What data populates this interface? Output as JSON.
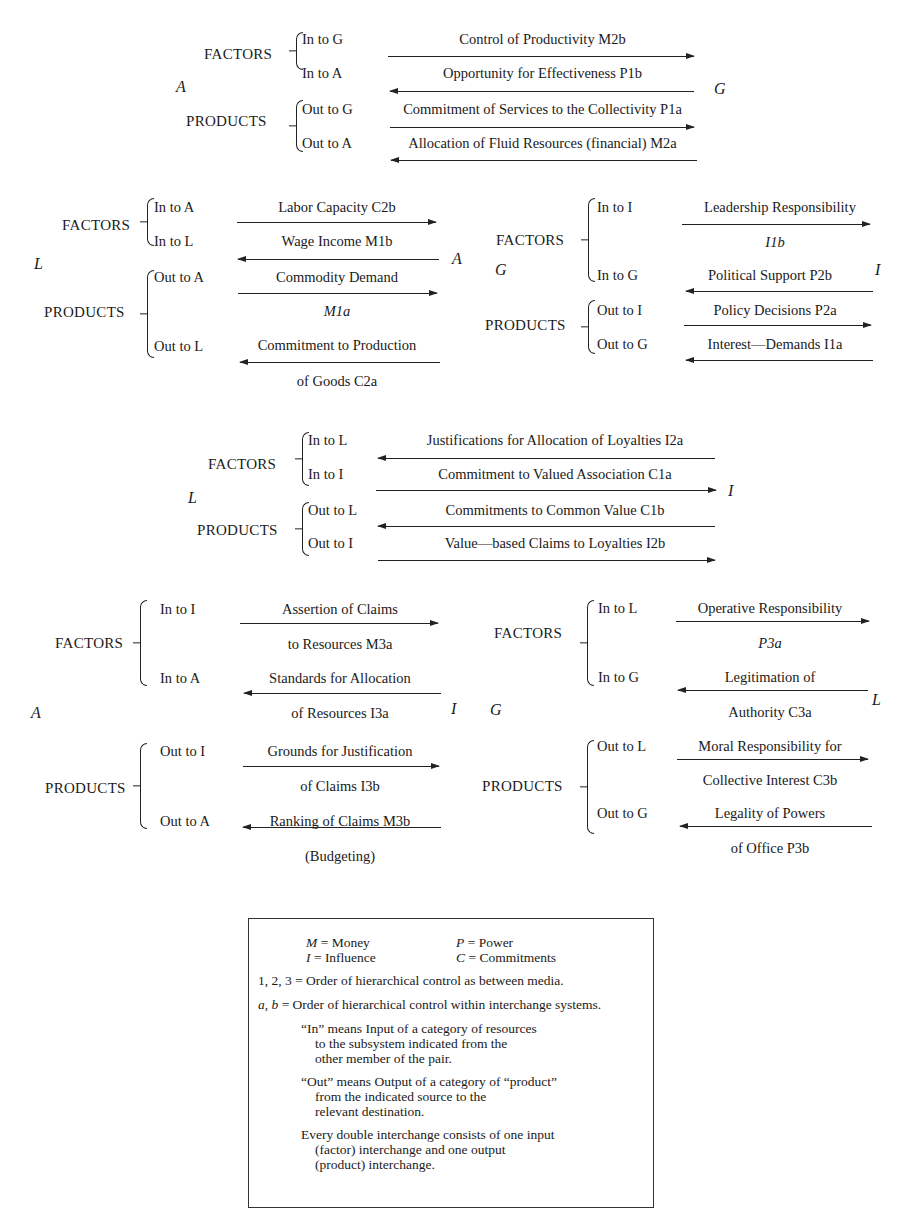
{
  "header": {
    "cutoff_text": ""
  },
  "panels": [
    {
      "id": "A-G",
      "left_node": "A",
      "right_node": "G",
      "factors_label": "FACTORS",
      "products_label": "PRODUCTS",
      "rows": [
        {
          "group": "FACTORS",
          "direction_label": "In to G",
          "text": "Control of Productivity M2b",
          "arrow": "right"
        },
        {
          "group": "FACTORS",
          "direction_label": "In to A",
          "text": "Opportunity for Effectiveness P1b",
          "arrow": "left"
        },
        {
          "group": "PRODUCTS",
          "direction_label": "Out to G",
          "text": "Commitment of Services to the Collectivity P1a",
          "arrow": "right"
        },
        {
          "group": "PRODUCTS",
          "direction_label": "Out to A",
          "text": "Allocation of Fluid Resources (financial) M2a",
          "arrow": "left"
        }
      ]
    },
    {
      "id": "L-A",
      "left_node": "L",
      "right_node": "A",
      "factors_label": "FACTORS",
      "products_label": "PRODUCTS",
      "rows": [
        {
          "group": "FACTORS",
          "direction_label": "In to A",
          "text": "Labor Capacity C2b",
          "arrow": "right"
        },
        {
          "group": "FACTORS",
          "direction_label": "In to L",
          "text": "Wage Income M1b",
          "arrow": "left"
        },
        {
          "group": "PRODUCTS",
          "direction_label": "Out to A",
          "text": "Commodity Demand",
          "text2": "M1a",
          "arrow": "right"
        },
        {
          "group": "PRODUCTS",
          "direction_label": "Out to L",
          "text": "Commitment to Production",
          "text2": "of Goods C2a",
          "arrow": "left"
        }
      ]
    },
    {
      "id": "G-I",
      "left_node": "G",
      "right_node": "I",
      "factors_label": "FACTORS",
      "products_label": "PRODUCTS",
      "rows": [
        {
          "group": "FACTORS",
          "direction_label": "In to I",
          "text": "Leadership Responsibility",
          "text2": "I1b",
          "arrow": "right"
        },
        {
          "group": "FACTORS",
          "direction_label": "In to G",
          "text": "Political Support P2b",
          "arrow": "left"
        },
        {
          "group": "PRODUCTS",
          "direction_label": "Out to I",
          "text": "Policy Decisions P2a",
          "arrow": "right"
        },
        {
          "group": "PRODUCTS",
          "direction_label": "Out to G",
          "text": "Interest—Demands I1a",
          "arrow": "left"
        }
      ]
    },
    {
      "id": "L-I",
      "left_node": "L",
      "right_node": "I",
      "factors_label": "FACTORS",
      "products_label": "PRODUCTS",
      "rows": [
        {
          "group": "FACTORS",
          "direction_label": "In to L",
          "text": "Justifications for Allocation of Loyalties I2a",
          "arrow": "left"
        },
        {
          "group": "FACTORS",
          "direction_label": "In to I",
          "text": "Commitment to Valued Association C1a",
          "arrow": "right"
        },
        {
          "group": "PRODUCTS",
          "direction_label": "Out to L",
          "text": "Commitments to Common Value C1b",
          "arrow": "left"
        },
        {
          "group": "PRODUCTS",
          "direction_label": "Out to I",
          "text": "Value—based Claims to Loyalties I2b",
          "arrow": "right"
        }
      ]
    },
    {
      "id": "A-I",
      "left_node": "A",
      "right_node": "I",
      "factors_label": "FACTORS",
      "products_label": "PRODUCTS",
      "rows": [
        {
          "group": "FACTORS",
          "direction_label": "In to I",
          "text": "Assertion of Claims",
          "text2": "to Resources M3a",
          "arrow": "right"
        },
        {
          "group": "FACTORS",
          "direction_label": "In to A",
          "text": "Standards for Allocation",
          "text2": "of Resources I3a",
          "arrow": "left"
        },
        {
          "group": "PRODUCTS",
          "direction_label": "Out to I",
          "text": "Grounds for Justification",
          "text2": "of Claims I3b",
          "arrow": "right"
        },
        {
          "group": "PRODUCTS",
          "direction_label": "Out to A",
          "text": "Ranking of Claims M3b",
          "text2": "(Budgeting)",
          "arrow": "left"
        }
      ]
    },
    {
      "id": "G-L",
      "left_node": "G",
      "right_node": "L",
      "factors_label": "FACTORS",
      "products_label": "PRODUCTS",
      "rows": [
        {
          "group": "FACTORS",
          "direction_label": "In to L",
          "text": "Operative Responsibility",
          "text2": "P3a",
          "arrow": "right"
        },
        {
          "group": "FACTORS",
          "direction_label": "In to G",
          "text": "Legitimation of",
          "text2": "Authority C3a",
          "arrow": "left"
        },
        {
          "group": "PRODUCTS",
          "direction_label": "Out to L",
          "text": "Moral Responsibility for",
          "text2": "Collective Interest C3b",
          "arrow": "right"
        },
        {
          "group": "PRODUCTS",
          "direction_label": "Out to G",
          "text": "Legality of Powers",
          "text2": "of Office P3b",
          "arrow": "left"
        }
      ]
    }
  ],
  "legend": {
    "media": [
      {
        "symbol": "M",
        "meaning": "Money"
      },
      {
        "symbol": "P",
        "meaning": "Power"
      },
      {
        "symbol": "I",
        "meaning": "Influence"
      },
      {
        "symbol": "C",
        "meaning": "Commitments"
      }
    ],
    "line_order_media": "1, 2, 3 = Order of hierarchical control as between media.",
    "line_order_within_prefix": "a, b",
    "line_order_within": " = Order of hierarchical control within interchange systems.",
    "in_def": [
      "“In” means Input of a category of resources",
      "to the subsystem indicated from the",
      "other member of the pair."
    ],
    "out_def": [
      "“Out” means Output of a category of “product”",
      "from the indicated source to the",
      "relevant destination."
    ],
    "double_def": [
      "Every double interchange consists of one input",
      "(factor) interchange and one output",
      "(product) interchange."
    ]
  }
}
